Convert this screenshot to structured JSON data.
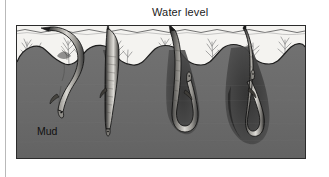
{
  "figure": {
    "caption_above": "Water level",
    "substrate_label": "Mud",
    "frame": {
      "x": 16,
      "y": 25,
      "width": 290,
      "height": 134
    }
  },
  "colors": {
    "page_background": "#ffffff",
    "page_rule": "#b9b9b9",
    "frame_border": "#2b2b2b",
    "water": "#f4f3f0",
    "water_surface_line": "#5a5a5a",
    "mud": "#6b6b6b",
    "mud_dark": "#5c5c5c",
    "mud_edge": "#1d1d1d",
    "vegetation": "#9a9a9a",
    "eel_body_light": "#d8d6d1",
    "eel_body_mid": "#9d9b96",
    "eel_body_dark": "#2a2a2a",
    "eel_outline": "#121212",
    "burrow_shadow": "#3a3a3a",
    "text": "#141414"
  },
  "scene": {
    "type": "cross-section-illustration",
    "subject": "eel-burrowing-sequence",
    "water_band": {
      "top": 0,
      "bottom": 34,
      "note": "shallow water above mud surface"
    },
    "mud_surface_mounds": 6,
    "mud_mound_peak_y": 22,
    "mud_trough_y": 40,
    "vegetation_tufts": 9,
    "eels": [
      {
        "index": 1,
        "stage": "head-down, body arched above surface, snout entering mud",
        "depth_label": "shallow",
        "head_x": 54,
        "head_y": 88,
        "tail_x": 32,
        "tail_y": 10
      },
      {
        "index": 2,
        "stage": "body nearly vertical, half submerged in mud",
        "depth_label": "partial",
        "head_x": 118,
        "head_y": 108,
        "tail_x": 112,
        "tail_y": 8
      },
      {
        "index": 3,
        "stage": "fully submerged, body folded in U-shaped burrow",
        "depth_label": "deep",
        "head_x": 182,
        "head_y": 126,
        "tail_x": 176,
        "tail_y": 18
      },
      {
        "index": 4,
        "stage": "completely buried, looped within burrow cavity",
        "depth_label": "complete",
        "head_x": 248,
        "head_y": 132,
        "tail_x": 244,
        "tail_y": 12
      }
    ]
  }
}
